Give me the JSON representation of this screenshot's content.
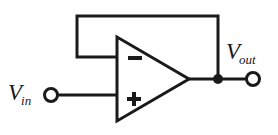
{
  "diagram": {
    "type": "schematic",
    "background_color": "#ffffff",
    "line_color": "#1a1a1a",
    "line_width": 3
  },
  "labels": {
    "input": {
      "symbol": "V",
      "subscript": "in",
      "full": "Vin"
    },
    "output": {
      "symbol": "V",
      "subscript": "out",
      "full": "Vout"
    }
  },
  "opamp": {
    "inverting_input_symbol": "−",
    "noninverting_input_symbol": "+",
    "triangle": {
      "top_left": [
        117,
        37
      ],
      "bottom_left": [
        117,
        121
      ],
      "tip": [
        189,
        79
      ]
    }
  },
  "nodes": {
    "input_terminal": {
      "cx": 51,
      "cy": 95,
      "r": 6.5
    },
    "output_terminal": {
      "cx": 253,
      "cy": 79,
      "r": 6.5
    },
    "output_junction_dot": {
      "cx": 218,
      "cy": 79,
      "r": 5
    }
  },
  "wires": {
    "input_wire": {
      "from": [
        58,
        95
      ],
      "to": [
        118,
        95
      ]
    },
    "output_wire": {
      "from": [
        188,
        79
      ],
      "to": [
        247,
        79
      ]
    },
    "feedback_top": {
      "from": [
        77,
        16
      ],
      "to": [
        218,
        16
      ]
    },
    "feedback_left_vertical": {
      "from": [
        77,
        16
      ],
      "to": [
        77,
        57
      ]
    },
    "feedback_to_inverting_input": {
      "from": [
        77,
        57
      ],
      "to": [
        125,
        57
      ]
    },
    "feedback_right_vertical": {
      "from": [
        218,
        16
      ],
      "to": [
        218,
        79
      ]
    }
  }
}
